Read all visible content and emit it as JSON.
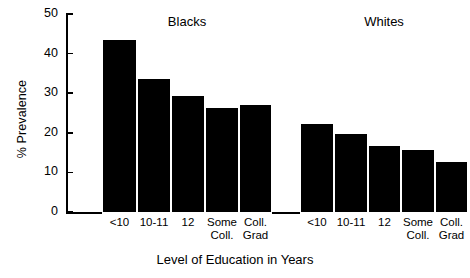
{
  "chart_data": {
    "type": "bar",
    "title": "",
    "xlabel": "Level of Education in Years",
    "ylabel": "% Prevalence",
    "ylim": [
      0,
      50
    ],
    "yticks": [
      0,
      10,
      20,
      30,
      40,
      50
    ],
    "ytick_labels": [
      "0",
      "10",
      "20",
      "30",
      "40",
      "50"
    ],
    "grid": false,
    "legend_position": "none",
    "categories": [
      "<10",
      "10-11",
      "12",
      "Some Coll.",
      "Coll. Grad"
    ],
    "group_labels": [
      "Blacks",
      "Whites"
    ],
    "series": [
      {
        "name": "Blacks",
        "values": [
          43.7,
          33.8,
          29.6,
          26.6,
          27.3
        ]
      },
      {
        "name": "Whites",
        "values": [
          22.7,
          20.2,
          17.2,
          16.1,
          13.0
        ]
      }
    ],
    "bar_color": "#000000",
    "background_color": "#ffffff"
  },
  "axis": {
    "y_title": "% Prevalence",
    "x_title": "Level of Education in Years",
    "tick_0": "0",
    "tick_10": "10",
    "tick_20": "20",
    "tick_30": "30",
    "tick_40": "40",
    "tick_50": "50"
  },
  "groups": {
    "blacks": {
      "title": "Blacks",
      "cat_0_line1": "<10",
      "cat_0_line2": "",
      "cat_1_line1": "10-11",
      "cat_1_line2": "",
      "cat_2_line1": "12",
      "cat_2_line2": "",
      "cat_3_line1": "Some",
      "cat_3_line2": "Coll.",
      "cat_4_line1": "Coll.",
      "cat_4_line2": "Grad"
    },
    "whites": {
      "title": "Whites",
      "cat_0_line1": "<10",
      "cat_0_line2": "",
      "cat_1_line1": "10-11",
      "cat_1_line2": "",
      "cat_2_line1": "12",
      "cat_2_line2": "",
      "cat_3_line1": "Some",
      "cat_3_line2": "Coll.",
      "cat_4_line1": "Coll.",
      "cat_4_line2": "Grad"
    }
  }
}
